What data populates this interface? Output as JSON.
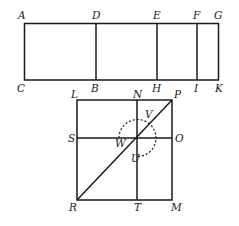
{
  "figure": {
    "type": "geometric-diagram",
    "upper_rectangle": {
      "corner_labels": {
        "top_left": "A",
        "bottom_left": "C",
        "top_right": "G",
        "bottom_right": "K"
      },
      "divider_labels": [
        {
          "top": "D",
          "bottom": "B"
        },
        {
          "top": "E",
          "bottom": "H"
        },
        {
          "top": "F",
          "bottom": "I"
        }
      ]
    },
    "lower_square": {
      "corner_labels": {
        "top_left": "L",
        "top_right": "P",
        "bottom_left": "R",
        "bottom_right": "M"
      },
      "vertical_line_labels": {
        "top": "N",
        "bottom": "T"
      },
      "horizontal_line_labels": {
        "left": "S",
        "right": "O"
      },
      "diagonal": "RP",
      "center_labels": {
        "left": "W",
        "upper": "V",
        "lower": "U"
      },
      "dashed_arc": "arc centered at intersection, from W around through V and O-side down to U"
    }
  },
  "labels": {
    "A": "A",
    "B": "B",
    "C": "C",
    "D": "D",
    "E": "E",
    "F": "F",
    "G": "G",
    "H": "H",
    "I": "I",
    "K": "K",
    "L": "L",
    "M": "M",
    "N": "N",
    "O": "O",
    "P": "P",
    "R": "R",
    "S": "S",
    "T": "T",
    "U": "U",
    "V": "V",
    "W": "W"
  }
}
